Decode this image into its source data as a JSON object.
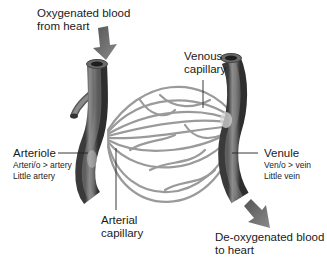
{
  "diagram": {
    "labels": {
      "oxygenated": {
        "line1": "Oxygenated blood",
        "line2": "from heart"
      },
      "venous_capillary": {
        "line1": "Venous",
        "line2": "capillary"
      },
      "arteriole": {
        "name": "Arteriole",
        "etymology": "Arteri/o > artery",
        "meaning": "Little artery"
      },
      "arterial_capillary": {
        "line1": "Arterial",
        "line2": "capillary"
      },
      "venule": {
        "name": "Venule",
        "etymology": "Ven/o > vein",
        "meaning": "Little vein"
      },
      "deoxygenated": {
        "line1": "De-oxygenated blood",
        "line2": "to heart"
      }
    },
    "colors": {
      "vessel_fill": "#7a7a7a",
      "vessel_dark": "#3a3a3a",
      "vessel_light": "#b8b8b8",
      "capillary": "#9a9a9a",
      "arrow": "#6e6e6e",
      "text": "#1a1a1a"
    }
  }
}
